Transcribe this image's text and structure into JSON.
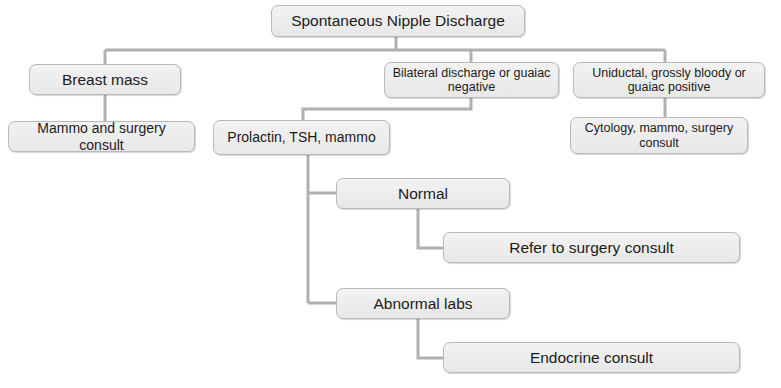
{
  "diagram": {
    "colors": {
      "node_fill": "#ededed",
      "node_border": "#b9b9b9",
      "connector": "#b0b0b0",
      "text": "#1b1b1b",
      "background": "#ffffff"
    },
    "nodes": [
      {
        "id": "root",
        "label": "Spontaneous Nipple Discharge",
        "x": 271,
        "y": 5,
        "w": 254,
        "h": 32,
        "size": "size-lg"
      },
      {
        "id": "breast-mass",
        "label": "Breast mass",
        "x": 29,
        "y": 64,
        "w": 152,
        "h": 31,
        "size": "size-lg"
      },
      {
        "id": "bilateral-discharge",
        "label": "Bilateral discharge or guaiac negative",
        "x": 384,
        "y": 62,
        "w": 175,
        "h": 36,
        "size": "size-sm"
      },
      {
        "id": "uniductal-bloody",
        "label": "Uniductal, grossly bloody or guaiac positive",
        "x": 573,
        "y": 62,
        "w": 192,
        "h": 36,
        "size": "size-sm"
      },
      {
        "id": "mammo-surgery-consult",
        "label": "Mammo and surgery consult",
        "x": 8,
        "y": 121,
        "w": 187,
        "h": 31,
        "size": "size-md"
      },
      {
        "id": "prolactin-tsh-mammo",
        "label": "Prolactin, TSH, mammo",
        "x": 213,
        "y": 120,
        "w": 177,
        "h": 35,
        "size": "size-md"
      },
      {
        "id": "cytology-mammo-surgery",
        "label": "Cytology, mammo, surgery consult",
        "x": 570,
        "y": 117,
        "w": 178,
        "h": 37,
        "size": "size-sm"
      },
      {
        "id": "normal",
        "label": "Normal",
        "x": 336,
        "y": 178,
        "w": 174,
        "h": 31,
        "size": "size-lg"
      },
      {
        "id": "refer-surgery-consult",
        "label": "Refer to surgery consult",
        "x": 443,
        "y": 232,
        "w": 297,
        "h": 31,
        "size": "size-lg"
      },
      {
        "id": "abnormal-labs",
        "label": "Abnormal labs",
        "x": 336,
        "y": 288,
        "w": 174,
        "h": 31,
        "size": "size-lg"
      },
      {
        "id": "endocrine-consult",
        "label": "Endocrine consult",
        "x": 443,
        "y": 342,
        "w": 297,
        "h": 31,
        "size": "size-lg"
      }
    ],
    "connectors": [
      {
        "id": "root-to-bus",
        "name": "connector-root-to-bus",
        "points": "396,37 396,50"
      },
      {
        "id": "bus-horizontal",
        "name": "connector-top-bus",
        "points": "105,50 665,50"
      },
      {
        "id": "bus-to-breast-mass",
        "name": "connector-bus-to-breast-mass",
        "points": "105,50 105,64"
      },
      {
        "id": "bus-to-bilateral",
        "name": "connector-bus-to-bilateral",
        "points": "471,50 471,62"
      },
      {
        "id": "bus-to-uniductal",
        "name": "connector-bus-to-uniductal",
        "points": "665,50 665,62"
      },
      {
        "id": "breast-to-mammo",
        "name": "connector-breast-mass-to-mammo-consult",
        "points": "105,95 105,121"
      },
      {
        "id": "bilateral-to-prolactin",
        "name": "connector-bilateral-to-prolactin",
        "points": "471,98 471,109 303,109 303,120"
      },
      {
        "id": "uniductal-to-cytology",
        "name": "connector-uniductal-to-cytology",
        "points": "665,98 665,117"
      },
      {
        "id": "prolactin-spine",
        "name": "connector-prolactin-spine",
        "points": "308,155 308,303"
      },
      {
        "id": "spine-to-normal",
        "name": "connector-spine-to-normal",
        "points": "308,193 336,193"
      },
      {
        "id": "spine-to-abnormal",
        "name": "connector-spine-to-abnormal-labs",
        "points": "308,303 336,303"
      },
      {
        "id": "normal-to-refer",
        "name": "connector-normal-to-refer-surgery",
        "points": "418,209 418,248 443,248"
      },
      {
        "id": "abnormal-to-endocrine",
        "name": "connector-abnormal-labs-to-endocrine",
        "points": "418,319 418,358 443,358"
      }
    ]
  }
}
